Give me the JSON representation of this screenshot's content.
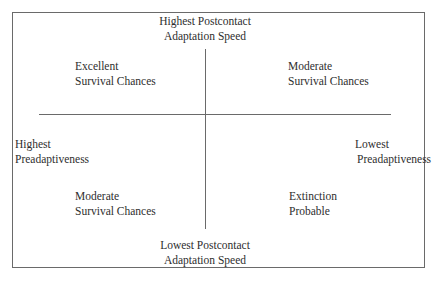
{
  "diagram": {
    "type": "quadrant",
    "axes": {
      "top": {
        "line1": "Highest Postcontact",
        "line2": "Adaptation Speed"
      },
      "bottom": {
        "line1": "Lowest Postcontact",
        "line2": "Adaptation Speed"
      },
      "left": {
        "line1": "Highest",
        "line2": "Preadaptiveness"
      },
      "right": {
        "line1": "Lowest",
        "line2": "Preadaptiveness"
      }
    },
    "quadrants": {
      "top_left": {
        "line1": "Excellent",
        "line2": "Survival Chances"
      },
      "top_right": {
        "line1": "Moderate",
        "line2": "Survival Chances"
      },
      "bottom_left": {
        "line1": "Moderate",
        "line2": "Survival Chances"
      },
      "bottom_right": {
        "line1": "Extinction",
        "line2": "Probable"
      }
    },
    "colors": {
      "line": "#6a6a6a",
      "text": "#2e2e2e",
      "background": "#ffffff"
    }
  }
}
